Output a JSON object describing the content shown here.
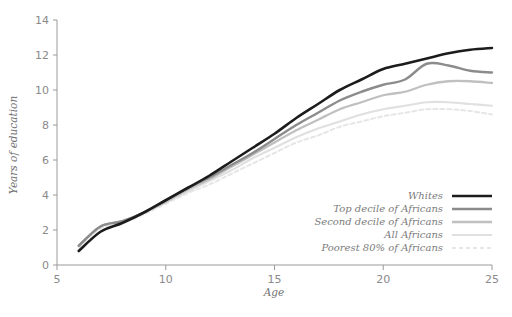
{
  "chart_data": {
    "type": "line",
    "title": "",
    "xlabel": "Age",
    "ylabel": "Years of education",
    "xlim": [
      5,
      25
    ],
    "ylim": [
      0,
      14
    ],
    "xticks": [
      5,
      10,
      15,
      20,
      25
    ],
    "yticks": [
      0,
      2,
      4,
      6,
      8,
      10,
      12,
      14
    ],
    "grid": false,
    "legend_position": "inside-lower-right",
    "x": [
      6,
      7,
      8,
      9,
      10,
      11,
      12,
      13,
      14,
      15,
      16,
      17,
      18,
      19,
      20,
      21,
      22,
      23,
      24,
      25
    ],
    "series": [
      {
        "name": "Whites",
        "color": "#1c1c1c",
        "width": 2.6,
        "dash": "none",
        "values": [
          0.8,
          1.9,
          2.4,
          3.0,
          3.7,
          4.4,
          5.1,
          5.9,
          6.7,
          7.5,
          8.4,
          9.2,
          10.0,
          10.6,
          11.2,
          11.5,
          11.8,
          12.1,
          12.3,
          12.4
        ]
      },
      {
        "name": "Top decile of Africans",
        "color": "#8c8c8c",
        "width": 2.4,
        "dash": "none",
        "values": [
          1.1,
          2.2,
          2.5,
          3.0,
          3.7,
          4.4,
          5.0,
          5.7,
          6.4,
          7.2,
          8.0,
          8.7,
          9.4,
          9.9,
          10.3,
          10.6,
          11.5,
          11.4,
          11.1,
          11.0
        ]
      },
      {
        "name": "Second decile of Africans",
        "color": "#c0c0c0",
        "width": 2.3,
        "dash": "none",
        "values": [
          1.1,
          2.2,
          2.5,
          3.0,
          3.6,
          4.3,
          4.9,
          5.6,
          6.3,
          7.0,
          7.7,
          8.3,
          8.9,
          9.3,
          9.7,
          9.9,
          10.3,
          10.5,
          10.5,
          10.4
        ]
      },
      {
        "name": "All Africans",
        "color": "#e0e0e0",
        "width": 2.2,
        "dash": "none",
        "values": [
          1.1,
          2.2,
          2.5,
          3.0,
          3.6,
          4.2,
          4.8,
          5.4,
          6.1,
          6.7,
          7.3,
          7.8,
          8.2,
          8.6,
          8.9,
          9.1,
          9.3,
          9.3,
          9.2,
          9.1
        ]
      },
      {
        "name": "Poorest 80% of Africans",
        "color": "#e6e6e6",
        "width": 2.0,
        "dash": "4 3",
        "values": [
          1.0,
          2.1,
          2.4,
          2.9,
          3.5,
          4.1,
          4.6,
          5.2,
          5.8,
          6.4,
          7.0,
          7.4,
          7.9,
          8.2,
          8.5,
          8.7,
          8.9,
          8.9,
          8.8,
          8.6
        ]
      }
    ]
  },
  "legend": {
    "entries": [
      {
        "label": "Whites"
      },
      {
        "label": "Top decile of Africans"
      },
      {
        "label": "Second decile of Africans"
      },
      {
        "label": "All Africans"
      },
      {
        "label": "Poorest 80% of Africans"
      }
    ]
  },
  "axes": {
    "y_title": "Years of education",
    "x_title": "Age",
    "y_tick_labels": [
      "0",
      "2",
      "4",
      "6",
      "8",
      "10",
      "12",
      "14"
    ],
    "x_tick_labels": [
      "5",
      "10",
      "15",
      "20",
      "25"
    ]
  }
}
